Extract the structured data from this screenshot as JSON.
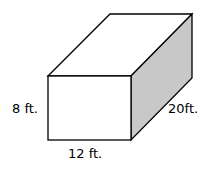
{
  "diagram": {
    "shape": "rectangular prism",
    "colors": {
      "line": "#000000",
      "side_face": "#c8c8c8",
      "front_face": "#ffffff"
    },
    "labels": {
      "height": "8 ft.",
      "width": "12 ft.",
      "depth": "20ft."
    }
  }
}
